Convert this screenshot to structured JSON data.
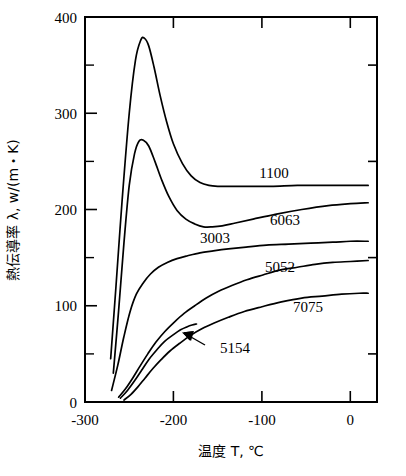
{
  "chart_data": {
    "type": "line",
    "title": "",
    "xlabel": "温度 T, ℃",
    "ylabel": "熱伝導率 λ, w/(m・K)",
    "xlim": [
      -300,
      30
    ],
    "ylim": [
      0,
      400
    ],
    "xticks": [
      -300,
      -200,
      -100,
      0
    ],
    "xtick_labels": [
      "-300",
      "-200",
      "-100",
      "0"
    ],
    "yticks": [
      0,
      100,
      200,
      300,
      400
    ],
    "ytick_labels": [
      "0",
      "100",
      "200",
      "300",
      "400"
    ],
    "yticks_minor": [
      50,
      150,
      250,
      350
    ],
    "grid": false,
    "legend": "inline-labels",
    "series": [
      {
        "name": "1100",
        "label": "1100",
        "points": [
          [
            -271,
            45
          ],
          [
            -265,
            120
          ],
          [
            -258,
            210
          ],
          [
            -250,
            300
          ],
          [
            -243,
            355
          ],
          [
            -237,
            376
          ],
          [
            -233,
            378
          ],
          [
            -228,
            370
          ],
          [
            -222,
            348
          ],
          [
            -215,
            318
          ],
          [
            -208,
            292
          ],
          [
            -200,
            268
          ],
          [
            -190,
            248
          ],
          [
            -180,
            235
          ],
          [
            -170,
            228
          ],
          [
            -160,
            225
          ],
          [
            -150,
            224
          ],
          [
            -140,
            224
          ],
          [
            -120,
            224
          ],
          [
            -90,
            224
          ],
          [
            -60,
            225
          ],
          [
            -30,
            225
          ],
          [
            0,
            225
          ],
          [
            20,
            225
          ]
        ]
      },
      {
        "name": "6063",
        "label": "6063",
        "points": [
          [
            -268,
            30
          ],
          [
            -262,
            95
          ],
          [
            -256,
            165
          ],
          [
            -250,
            225
          ],
          [
            -244,
            258
          ],
          [
            -239,
            271
          ],
          [
            -234,
            272
          ],
          [
            -228,
            266
          ],
          [
            -221,
            250
          ],
          [
            -213,
            230
          ],
          [
            -205,
            213
          ],
          [
            -196,
            199
          ],
          [
            -186,
            190
          ],
          [
            -176,
            185
          ],
          [
            -166,
            182
          ],
          [
            -156,
            182
          ],
          [
            -145,
            183
          ],
          [
            -130,
            186
          ],
          [
            -110,
            190
          ],
          [
            -85,
            195
          ],
          [
            -55,
            200
          ],
          [
            -25,
            204
          ],
          [
            0,
            206
          ],
          [
            20,
            207
          ]
        ]
      },
      {
        "name": "3003",
        "label": "3003",
        "points": [
          [
            -270,
            12
          ],
          [
            -263,
            38
          ],
          [
            -256,
            68
          ],
          [
            -249,
            94
          ],
          [
            -242,
            112
          ],
          [
            -234,
            124
          ],
          [
            -226,
            133
          ],
          [
            -217,
            140
          ],
          [
            -207,
            145
          ],
          [
            -196,
            149
          ],
          [
            -184,
            152
          ],
          [
            -170,
            155
          ],
          [
            -155,
            157
          ],
          [
            -138,
            159
          ],
          [
            -118,
            161
          ],
          [
            -95,
            163
          ],
          [
            -70,
            164
          ],
          [
            -45,
            165
          ],
          [
            -20,
            166
          ],
          [
            0,
            167
          ],
          [
            20,
            167
          ]
        ]
      },
      {
        "name": "5052",
        "label": "5052",
        "points": [
          [
            -262,
            5
          ],
          [
            -254,
            14
          ],
          [
            -246,
            25
          ],
          [
            -238,
            37
          ],
          [
            -229,
            50
          ],
          [
            -220,
            62
          ],
          [
            -210,
            73
          ],
          [
            -199,
            83
          ],
          [
            -188,
            92
          ],
          [
            -176,
            100
          ],
          [
            -163,
            108
          ],
          [
            -149,
            115
          ],
          [
            -134,
            121
          ],
          [
            -117,
            127
          ],
          [
            -99,
            132
          ],
          [
            -80,
            137
          ],
          [
            -60,
            140
          ],
          [
            -40,
            143
          ],
          [
            -20,
            145
          ],
          [
            0,
            146
          ],
          [
            20,
            147
          ]
        ]
      },
      {
        "name": "5154",
        "label": "5154",
        "points": [
          [
            -260,
            4
          ],
          [
            -252,
            12
          ],
          [
            -244,
            22
          ],
          [
            -236,
            33
          ],
          [
            -228,
            44
          ],
          [
            -219,
            54
          ],
          [
            -210,
            63
          ],
          [
            -200,
            70
          ],
          [
            -192,
            75
          ],
          [
            -185,
            78
          ],
          [
            -179,
            80
          ],
          [
            -174,
            81
          ]
        ]
      },
      {
        "name": "7075",
        "label": "7075",
        "points": [
          [
            -256,
            2
          ],
          [
            -248,
            8
          ],
          [
            -240,
            16
          ],
          [
            -232,
            25
          ],
          [
            -223,
            35
          ],
          [
            -214,
            44
          ],
          [
            -204,
            53
          ],
          [
            -193,
            61
          ],
          [
            -181,
            69
          ],
          [
            -168,
            76
          ],
          [
            -154,
            82
          ],
          [
            -138,
            88
          ],
          [
            -120,
            94
          ],
          [
            -100,
            99
          ],
          [
            -78,
            104
          ],
          [
            -55,
            108
          ],
          [
            -32,
            110
          ],
          [
            -10,
            112
          ],
          [
            10,
            113
          ],
          [
            20,
            113
          ]
        ]
      }
    ],
    "annotations": [
      {
        "name": "5154-pointer",
        "text": "5154",
        "target_x": -188,
        "target_y": 62
      }
    ]
  },
  "labels": {
    "s1100": "1100",
    "s6063": "6063",
    "s3003": "3003",
    "s5052": "5052",
    "s7075": "7075",
    "s5154": "5154",
    "y400": "400",
    "y300": "300",
    "y200": "200",
    "y100": "100",
    "y0": "0",
    "xm300": "-300",
    "xm200": "-200",
    "xm100": "-100",
    "x0": "0",
    "xaxis_title": "温度 T, ℃",
    "yaxis_title": "熱伝導率 λ, w/(m・K)"
  }
}
